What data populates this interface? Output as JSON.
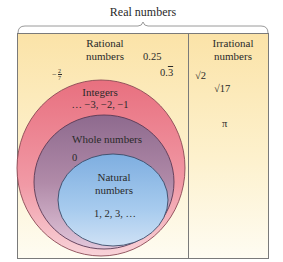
{
  "title": "Real numbers",
  "sets": {
    "rational": {
      "label_line1": "Rational",
      "label_line2": "numbers",
      "examples": [
        "0.25",
        "0.3",
        "-2/7"
      ]
    },
    "irrational": {
      "label_line1": "Irrational",
      "label_line2": "numbers",
      "examples": [
        "√2",
        "√17",
        "π"
      ]
    },
    "integers": {
      "label": "Integers",
      "examples": "… −3, −2, −1"
    },
    "whole": {
      "label": "Whole numbers",
      "examples": "0"
    },
    "natural": {
      "label_line1": "Natural",
      "label_line2": "numbers",
      "examples": "1, 2, 3, …"
    }
  },
  "rational_examples": {
    "decimal": "0.25",
    "repeating_base": "0.",
    "repeating_digit": "3",
    "fraction_sign": "−",
    "fraction_num": "2",
    "fraction_den": "7"
  },
  "irrational_examples": {
    "sqrt2": "√2",
    "sqrt17": "√17",
    "pi": "π"
  },
  "colors": {
    "background_top": "#fbe3a8",
    "background_bottom": "#fdfbf0",
    "integers_fill": "#ee8f9c",
    "whole_fill": "#a8819e",
    "natural_fill": "#9cc4ea",
    "border": "#7a7a7a"
  }
}
